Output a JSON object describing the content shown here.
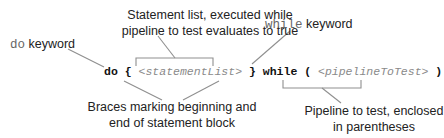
{
  "annotations": {
    "statement_list": [
      "Statement list, executed while",
      "pipeline to test evaluates to true"
    ],
    "do_keyword": {
      "code": "do",
      "text": " keyword"
    },
    "while_keyword": {
      "code": "while",
      "text": " keyword"
    },
    "braces": [
      "Braces marking beginning and",
      "end of statement block"
    ],
    "pipeline": [
      "Pipeline to test, enclosed",
      "in parentheses"
    ]
  },
  "code": {
    "do": "do",
    "open_brace": "{",
    "statement_list": "<statementList>",
    "close_brace": "}",
    "while": "while",
    "open_paren": "(",
    "pipeline": "<pipelineToTest>",
    "close_paren": ")"
  },
  "colors": {
    "line": "#8f8f8f",
    "placeholder": "#8a8a8a",
    "text": "#222222"
  }
}
